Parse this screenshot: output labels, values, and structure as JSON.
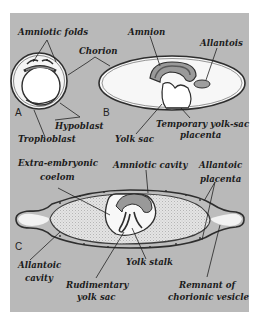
{
  "figure": {
    "panels": [
      {
        "letter": "A",
        "name": "early-implantation-stage"
      },
      {
        "letter": "B",
        "name": "yolk-sac-placenta-stage"
      },
      {
        "letter": "C",
        "name": "allantoic-placenta-stage"
      }
    ],
    "labels": {
      "amniotic_folds": "Amniotic folds",
      "chorion": "Chorion",
      "amnion": "Amnion",
      "allantois": "Allantois",
      "hypoblast": "Hypoblast",
      "trophoblast": "Trophoblast",
      "yolk_sac": "Yolk sac",
      "temp_placenta_1": "Temporary yolk-sac",
      "temp_placenta_2": "placenta",
      "extra_coelom_1": "Extra-embryonic",
      "extra_coelom_2": "coelom",
      "amniotic_cavity": "Amniotic cavity",
      "allantoic_placenta_1": "Allantoic",
      "allantoic_placenta_2": "placenta",
      "allantoic_cavity_1": "Allantoic",
      "allantoic_cavity_2": "cavity",
      "yolk_stalk": "Yolk stalk",
      "rudimentary_1": "Rudimentary",
      "rudimentary_2": "yolk sac",
      "remnant_1": "Remnant of",
      "remnant_2": "chorionic vesicle"
    },
    "colors": {
      "background_panel": "#b9b9b9",
      "cavity_white": "#f7f7f7",
      "allantoic_fill": "#e2e2e2",
      "membrane_dark": "#2e2e2e",
      "membrane_mid": "#8a8a8a"
    }
  }
}
